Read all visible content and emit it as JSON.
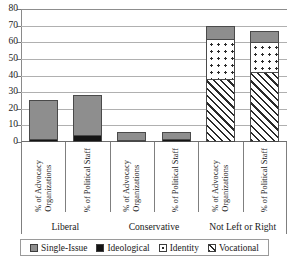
{
  "chart_data": {
    "type": "bar",
    "subtype": "stacked-vertical",
    "title": "",
    "title_clipped_fragment": "",
    "xlabel": "",
    "ylabel": "",
    "ylim": [
      0,
      80
    ],
    "ytick_step": 10,
    "yticks": [
      "80",
      "70",
      "60",
      "50",
      "40",
      "30",
      "20",
      "10",
      "0"
    ],
    "grid": true,
    "grid_axis": "y",
    "legend_position": "bottom",
    "categories": [
      "% of Advocacy Organizations",
      "% of Political Staff",
      "% of Advocacy Organizations",
      "% of Political Staff",
      "% of Advocacy Organizations",
      "% of Political Staff"
    ],
    "category_lines": [
      [
        "% of Advocacy",
        "Organizations"
      ],
      [
        "% of Political Staff"
      ],
      [
        "% of Advocacy",
        "Organizations"
      ],
      [
        "% of Political Staff"
      ],
      [
        "% of Advocacy",
        "Organizations"
      ],
      [
        "% of Political Staff"
      ]
    ],
    "groups": [
      {
        "label": "Liberal",
        "categories": [
          0,
          1
        ]
      },
      {
        "label": "Conservative",
        "categories": [
          2,
          3
        ]
      },
      {
        "label": "Not Left or Right",
        "categories": [
          4,
          5
        ]
      }
    ],
    "series": [
      {
        "name": "Single-Issue",
        "pattern": "solid-gray",
        "color": "#8e8e8e",
        "values": [
          23,
          24,
          5,
          4,
          8,
          7
        ]
      },
      {
        "name": "Ideological",
        "pattern": "solid-black",
        "color": "#141414",
        "values": [
          2,
          4,
          1,
          2,
          0,
          0
        ]
      },
      {
        "name": "Identity",
        "pattern": "dotted",
        "color": "#ffffff",
        "values": [
          0,
          0,
          0,
          0,
          24,
          18
        ]
      },
      {
        "name": "Vocational",
        "pattern": "diagonal-hatch",
        "color": "#ffffff",
        "values": [
          0,
          0,
          0,
          0,
          38,
          42
        ]
      }
    ],
    "stack_order_bottom_to_top": [
      "Vocational",
      "Identity",
      "Ideological",
      "Single-Issue"
    ],
    "totals": [
      25,
      28,
      6,
      6,
      70,
      67
    ]
  },
  "legend": {
    "items": [
      {
        "label": "Single-Issue"
      },
      {
        "label": "Ideological"
      },
      {
        "label": "Identity"
      },
      {
        "label": "Vocational"
      }
    ]
  }
}
